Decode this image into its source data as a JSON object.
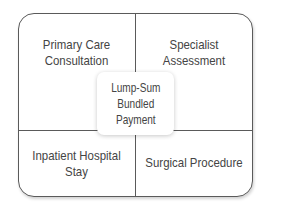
{
  "diagram": {
    "quadrants": {
      "top_left": [
        "Primary Care",
        "Consultation"
      ],
      "top_right": [
        "Specialist",
        "Assessment"
      ],
      "bottom_left": [
        "Inpatient Hospital",
        "Stay"
      ],
      "bottom_right": [
        "Surgical Procedure"
      ]
    },
    "center": [
      "Lump-Sum",
      "Bundled",
      "Payment"
    ],
    "colors": {
      "line": "#5a5a5a",
      "text": "#444444",
      "background": "#ffffff"
    }
  }
}
